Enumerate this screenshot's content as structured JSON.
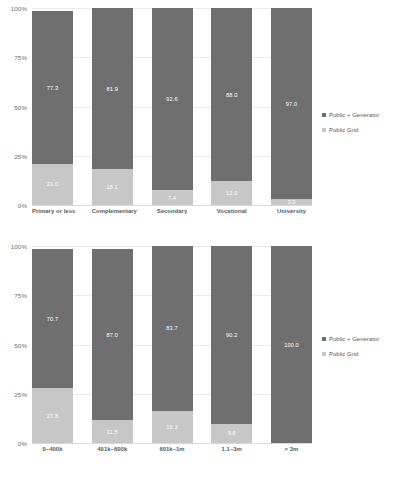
{
  "chart_data": [
    {
      "id": "top",
      "type": "bar",
      "stacked": true,
      "title": "",
      "xlabel": "",
      "ylabel": "",
      "ylim": [
        0,
        100
      ],
      "yticks": [
        "0%",
        "25%",
        "50%",
        "75%",
        "100%"
      ],
      "ytick_values": [
        0,
        25,
        50,
        75,
        100
      ],
      "grid": true,
      "legend_position": "right",
      "categories": [
        "Primary or less",
        "Complementary",
        "Secondary",
        "Vocational",
        "University"
      ],
      "series": [
        {
          "name": "Public + Generator",
          "color": "#6f6f6f",
          "values": [
            77.3,
            81.9,
            92.6,
            88.0,
            97.0
          ]
        },
        {
          "name": "Public Grid",
          "color": "#c7c7c7",
          "values": [
            21.0,
            18.1,
            7.4,
            12.0,
            3.0
          ]
        }
      ]
    },
    {
      "id": "bottom",
      "type": "bar",
      "stacked": true,
      "title": "",
      "xlabel": "",
      "ylabel": "",
      "ylim": [
        0,
        100
      ],
      "yticks": [
        "0%",
        "25%",
        "50%",
        "75%",
        "100%"
      ],
      "ytick_values": [
        0,
        25,
        50,
        75,
        100
      ],
      "grid": true,
      "legend_position": "right",
      "categories": [
        "0–400k",
        "401k–600k",
        "601k–1m",
        "1.1–3m",
        "> 3m"
      ],
      "series": [
        {
          "name": "Public + Generator",
          "color": "#6f6f6f",
          "values": [
            70.7,
            87.0,
            83.7,
            90.2,
            100.0
          ]
        },
        {
          "name": "Public Grid",
          "color": "#c7c7c7",
          "values": [
            27.8,
            11.5,
            16.3,
            9.8,
            0.0
          ]
        }
      ]
    }
  ],
  "legend": {
    "items": [
      {
        "label": "Public + Generator",
        "color": "#6f6f6f"
      },
      {
        "label": "Public Grid",
        "color": "#c7c7c7"
      }
    ]
  },
  "colors": {
    "public_generator": "#6f6f6f",
    "public_grid": "#c7c7c7",
    "gridline": "#e9e9e9",
    "text": "#595959",
    "background": "#ffffff"
  }
}
